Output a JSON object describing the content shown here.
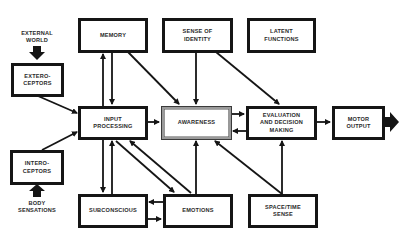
{
  "diagram": {
    "nodes": {
      "memory": "MEMORY",
      "sense_of_identity": "SENSE OF\nIDENTITY",
      "latent_functions": "LATENT\nFUNCTIONS",
      "exteroceptors": "EXTERO-\nCEPTORS",
      "input_processing": "INPUT\nPROCESSING",
      "awareness": "AWARENESS",
      "evaluation": "EVALUATION\nAND DECISION\nMAKING",
      "motor_output": "MOTOR\nOUTPUT",
      "interoceptors": "INTERO-\nCEPTORS",
      "subconscious": "SUBCONSCIOUS",
      "emotions": "EMOTIONS",
      "space_time_sense": "SPACE/TIME\nSENSE"
    },
    "inputs": {
      "external_world": "EXTERNAL\nWORLD",
      "body_sensations": "BODY\nSENSATIONS"
    },
    "edges": [
      {
        "from": "EXTERNAL WORLD",
        "to": "EXTERO-CEPTORS"
      },
      {
        "from": "BODY SENSATIONS",
        "to": "INTERO-CEPTORS"
      },
      {
        "from": "EXTERO-CEPTORS",
        "to": "INPUT PROCESSING"
      },
      {
        "from": "INTERO-CEPTORS",
        "to": "INPUT PROCESSING"
      },
      {
        "from": "INPUT PROCESSING",
        "to": "MEMORY"
      },
      {
        "from": "MEMORY",
        "to": "INPUT PROCESSING"
      },
      {
        "from": "MEMORY",
        "to": "AWARENESS"
      },
      {
        "from": "SENSE OF IDENTITY",
        "to": "AWARENESS"
      },
      {
        "from": "SENSE OF IDENTITY",
        "to": "EVALUATION AND DECISION MAKING"
      },
      {
        "from": "INPUT PROCESSING",
        "to": "AWARENESS"
      },
      {
        "from": "AWARENESS",
        "to": "EVALUATION AND DECISION MAKING"
      },
      {
        "from": "EVALUATION AND DECISION MAKING",
        "to": "AWARENESS"
      },
      {
        "from": "EVALUATION AND DECISION MAKING",
        "to": "MOTOR OUTPUT"
      },
      {
        "from": "MOTOR OUTPUT",
        "to": "(output)"
      },
      {
        "from": "INPUT PROCESSING",
        "to": "SUBCONSCIOUS"
      },
      {
        "from": "SUBCONSCIOUS",
        "to": "INPUT PROCESSING"
      },
      {
        "from": "INPUT PROCESSING",
        "to": "EMOTIONS"
      },
      {
        "from": "EMOTIONS",
        "to": "INPUT PROCESSING"
      },
      {
        "from": "EMOTIONS",
        "to": "SUBCONSCIOUS"
      },
      {
        "from": "SUBCONSCIOUS",
        "to": "EMOTIONS"
      },
      {
        "from": "EMOTIONS",
        "to": "AWARENESS"
      },
      {
        "from": "SPACE/TIME SENSE",
        "to": "AWARENESS"
      },
      {
        "from": "SPACE/TIME SENSE",
        "to": "EVALUATION AND DECISION MAKING"
      }
    ],
    "colors": {
      "stroke": "#151515",
      "background": "#ffffff",
      "awareness_border": "#9a9a9a"
    }
  }
}
